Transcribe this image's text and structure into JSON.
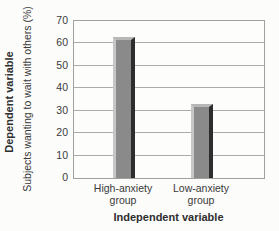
{
  "chart_data": {
    "type": "bar",
    "title": "",
    "categories": [
      "High-anxiety group",
      "Low-anxiety group"
    ],
    "values": [
      63,
      33
    ],
    "xlabel": "Independent variable",
    "ylabel_title": "Dependent variable",
    "ylabel": "Subjects wanting to wait with others (%)",
    "yticks": [
      0,
      10,
      20,
      30,
      40,
      50,
      60,
      70
    ],
    "ylim": [
      0,
      70
    ],
    "grid": true,
    "legend": "none",
    "bar_centers_frac": [
      0.265,
      0.675
    ],
    "bar_width_px": 22,
    "colors": {
      "bar_body": "#8a8a8a",
      "bar_highlight_left": "#c6c6c6",
      "bar_shadow_right": "#2d2d2d",
      "bar_top_cap": "#b7b7b7",
      "gridline": "#ababab",
      "plot_border": "#a0a0a0",
      "text": "#3a3a3a",
      "background": "#fcfcfb"
    }
  }
}
